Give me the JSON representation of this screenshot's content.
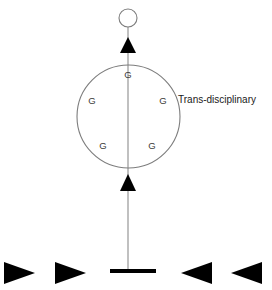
{
  "diagram": {
    "background_color": "#ffffff",
    "line_color": "#8c8c8c",
    "shape_color": "#000000",
    "label_color": "#1a1a1a",
    "top_node": {
      "name": "outcome-circle",
      "filled": false,
      "cx": 128,
      "cy": 18,
      "r": 9
    },
    "main_circle": {
      "name": "integration-circle",
      "filled": false,
      "cx": 128.5,
      "cy": 116.5,
      "r": 51.5,
      "side_label": "Trans-disciplinary",
      "side_label_x": 178,
      "side_label_y": 100
    },
    "node_labels": [
      {
        "text": "G",
        "x": 128,
        "y": 75
      },
      {
        "text": "G",
        "x": 92,
        "y": 101
      },
      {
        "text": "G",
        "x": 163,
        "y": 101
      },
      {
        "text": "G",
        "x": 103,
        "y": 146
      },
      {
        "text": "G",
        "x": 152,
        "y": 146
      }
    ],
    "vertical_axis": {
      "name": "central-axis-line",
      "x": 128,
      "y_top": 27,
      "y_bottom": 272
    },
    "up_arrowheads": [
      {
        "name": "upper-arrowhead",
        "cx": 128,
        "tip_y": 37,
        "base_y": 53,
        "half_width": 8
      },
      {
        "name": "middle-arrowhead",
        "cx": 128,
        "tip_y": 174,
        "base_y": 191,
        "half_width": 8
      }
    ],
    "base_bar": {
      "name": "foundation-bar",
      "x_left": 110,
      "x_right": 156,
      "y": 271,
      "thickness": 4
    },
    "converging_arrows": [
      {
        "name": "left-outer-arrow",
        "direction": "right",
        "x_tail": 4,
        "x_tip": 35,
        "cy": 273,
        "half_height": 11
      },
      {
        "name": "left-inner-arrow",
        "direction": "right",
        "x_tail": 55,
        "x_tip": 86,
        "cy": 273,
        "half_height": 11
      },
      {
        "name": "right-inner-arrow",
        "direction": "left",
        "x_tail": 212,
        "x_tip": 181,
        "cy": 273,
        "half_height": 11
      },
      {
        "name": "right-outer-arrow",
        "direction": "left",
        "x_tail": 262,
        "x_tip": 231,
        "cy": 273,
        "half_height": 11
      }
    ]
  }
}
